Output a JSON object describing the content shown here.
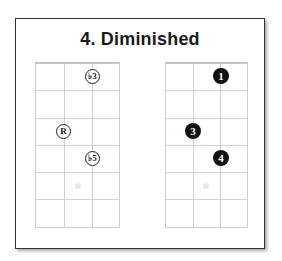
{
  "title": "4.  Diminished",
  "diagrams": [
    {
      "name": "interval-diagram",
      "dots": [
        {
          "label": "♭3",
          "string": 3,
          "fret": 1
        },
        {
          "label": "R",
          "string": 1,
          "fret": 3
        },
        {
          "label": "♭5",
          "string": 2,
          "fret": 4
        }
      ]
    },
    {
      "name": "fingering-diagram",
      "dots": [
        {
          "label": "1",
          "string": 3,
          "fret": 1
        },
        {
          "label": "3",
          "string": 1,
          "fret": 3
        },
        {
          "label": "4",
          "string": 2,
          "fret": 4
        }
      ]
    }
  ],
  "colors": {
    "frame": "#333333",
    "grid": "#d2d2d2",
    "dot_filled": "#111111"
  }
}
